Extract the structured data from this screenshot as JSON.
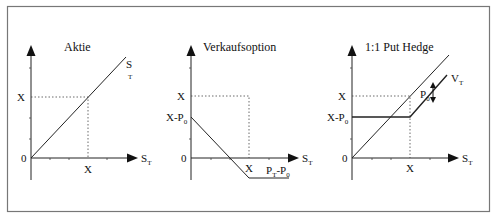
{
  "figure": {
    "frame": {
      "border_color": "#777777"
    },
    "panels": [
      {
        "id": "aktie",
        "title": "Aktie",
        "y_labels": {
          "strike": "X",
          "origin": "0"
        },
        "x_labels": {
          "strike": "X",
          "axis_main": "S",
          "axis_sub": "T"
        },
        "curve_label": {
          "main": "S",
          "sub": "T"
        }
      },
      {
        "id": "verkaufsoption",
        "title": "Verkaufsoption",
        "y_labels": {
          "strike": "X",
          "strike_minus_premium_main": "X-P",
          "strike_minus_premium_sub": "0",
          "origin": "0"
        },
        "x_labels": {
          "strike": "X",
          "axis_main": "S",
          "axis_sub": "T"
        },
        "curve_label": {
          "p1": "P",
          "p1_sub": "T",
          "dash": "-P",
          "p2_sub": "0"
        }
      },
      {
        "id": "put-hedge",
        "title": "1:1 Put Hedge",
        "y_labels": {
          "strike": "X",
          "strike_minus_premium_main": "X-P",
          "strike_minus_premium_sub": "0",
          "origin": "0"
        },
        "x_labels": {
          "strike": "X",
          "axis_main": "S",
          "axis_sub": "T"
        },
        "curve_label": {
          "main": "V",
          "sub": "T"
        },
        "gap_label": {
          "main": "P",
          "sub": "0"
        }
      }
    ]
  }
}
